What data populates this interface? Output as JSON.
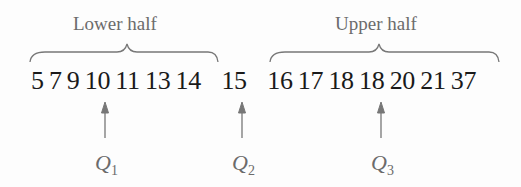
{
  "diagram": {
    "lower_label": "Lower half",
    "upper_label": "Upper half",
    "lower_values": [
      "5",
      "7",
      "9",
      "10",
      "11",
      "13",
      "14"
    ],
    "median_value": "15",
    "upper_values": [
      "16",
      "17",
      "18",
      "18",
      "20",
      "21",
      "37"
    ],
    "quartiles": [
      {
        "symbol": "Q",
        "sub": "1",
        "points_to": "10"
      },
      {
        "symbol": "Q",
        "sub": "2",
        "points_to": "15"
      },
      {
        "symbol": "Q",
        "sub": "3",
        "points_to": "18"
      }
    ],
    "colors": {
      "text": "#1a1a1a",
      "annotation": "#6b6b6b"
    }
  }
}
